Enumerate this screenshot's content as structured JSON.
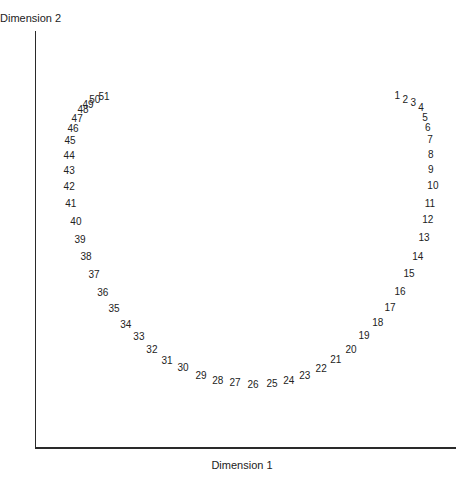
{
  "chart_data": {
    "type": "scatter",
    "title": "",
    "xlabel": "Dimension 1",
    "ylabel": "Dimension 2",
    "grid": false,
    "legend": null,
    "xlim": [
      0,
      100
    ],
    "ylim": [
      0,
      100
    ],
    "tick_labels": "none",
    "marker": "text-labels",
    "points": [
      {
        "label": "1",
        "x": 86.0,
        "y": 84.4
      },
      {
        "label": "2",
        "x": 87.9,
        "y": 83.5
      },
      {
        "label": "3",
        "x": 89.8,
        "y": 82.7
      },
      {
        "label": "4",
        "x": 91.7,
        "y": 81.5
      },
      {
        "label": "5",
        "x": 92.6,
        "y": 79.1
      },
      {
        "label": "6",
        "x": 93.3,
        "y": 76.7
      },
      {
        "label": "7",
        "x": 93.8,
        "y": 73.9
      },
      {
        "label": "8",
        "x": 94.0,
        "y": 70.3
      },
      {
        "label": "9",
        "x": 94.0,
        "y": 66.7
      },
      {
        "label": "10",
        "x": 94.5,
        "y": 62.8
      },
      {
        "label": "11",
        "x": 93.8,
        "y": 58.5
      },
      {
        "label": "12",
        "x": 93.3,
        "y": 54.7
      },
      {
        "label": "13",
        "x": 92.4,
        "y": 50.4
      },
      {
        "label": "14",
        "x": 90.9,
        "y": 45.8
      },
      {
        "label": "15",
        "x": 88.8,
        "y": 41.7
      },
      {
        "label": "16",
        "x": 86.7,
        "y": 37.4
      },
      {
        "label": "17",
        "x": 84.3,
        "y": 33.6
      },
      {
        "label": "18",
        "x": 81.4,
        "y": 30.0
      },
      {
        "label": "19",
        "x": 78.1,
        "y": 26.9
      },
      {
        "label": "20",
        "x": 75.0,
        "y": 23.5
      },
      {
        "label": "21",
        "x": 71.4,
        "y": 21.1
      },
      {
        "label": "22",
        "x": 67.9,
        "y": 19.0
      },
      {
        "label": "23",
        "x": 64.0,
        "y": 17.3
      },
      {
        "label": "24",
        "x": 60.2,
        "y": 16.1
      },
      {
        "label": "25",
        "x": 56.2,
        "y": 15.3
      },
      {
        "label": "26",
        "x": 51.7,
        "y": 15.1
      },
      {
        "label": "27",
        "x": 47.4,
        "y": 15.6
      },
      {
        "label": "28",
        "x": 43.3,
        "y": 16.1
      },
      {
        "label": "29",
        "x": 39.3,
        "y": 17.3
      },
      {
        "label": "30",
        "x": 35.0,
        "y": 19.2
      },
      {
        "label": "31",
        "x": 31.2,
        "y": 20.9
      },
      {
        "label": "32",
        "x": 27.6,
        "y": 23.5
      },
      {
        "label": "33",
        "x": 24.5,
        "y": 26.6
      },
      {
        "label": "34",
        "x": 21.4,
        "y": 29.5
      },
      {
        "label": "35",
        "x": 18.6,
        "y": 33.3
      },
      {
        "label": "36",
        "x": 15.9,
        "y": 37.2
      },
      {
        "label": "37",
        "x": 13.8,
        "y": 41.5
      },
      {
        "label": "38",
        "x": 11.9,
        "y": 45.8
      },
      {
        "label": "39",
        "x": 10.5,
        "y": 49.9
      },
      {
        "label": "40",
        "x": 9.5,
        "y": 54.2
      },
      {
        "label": "41",
        "x": 8.3,
        "y": 58.5
      },
      {
        "label": "42",
        "x": 7.9,
        "y": 62.6
      },
      {
        "label": "43",
        "x": 7.9,
        "y": 66.4
      },
      {
        "label": "44",
        "x": 7.9,
        "y": 70.0
      },
      {
        "label": "45",
        "x": 8.1,
        "y": 73.6
      },
      {
        "label": "46",
        "x": 8.8,
        "y": 76.5
      },
      {
        "label": "47",
        "x": 9.8,
        "y": 78.9
      },
      {
        "label": "48",
        "x": 11.2,
        "y": 81.1
      },
      {
        "label": "49",
        "x": 12.4,
        "y": 82.3
      },
      {
        "label": "50",
        "x": 14.0,
        "y": 83.5
      },
      {
        "label": "51",
        "x": 16.2,
        "y": 84.2
      }
    ]
  },
  "axes": {
    "x_label": "Dimension 1",
    "y_label": "Dimension 2"
  },
  "colors": {
    "background": "#ffffff",
    "axis": "#2a2a2a",
    "text": "#222222"
  }
}
